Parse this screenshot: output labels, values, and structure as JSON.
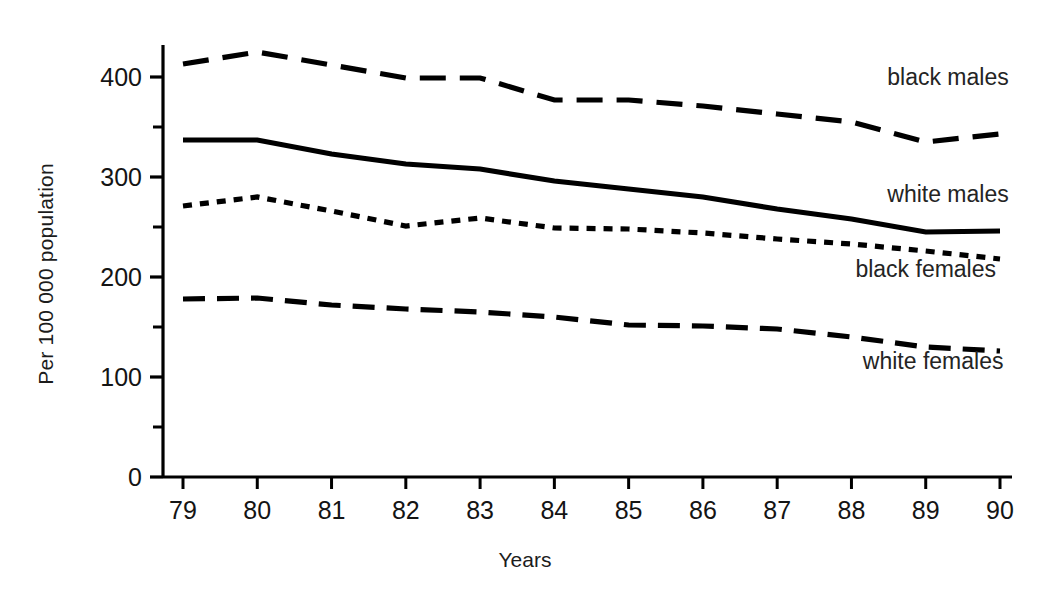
{
  "chart_data": {
    "type": "line",
    "title": "",
    "subtitle": "",
    "xlabel": "Years",
    "ylabel": "Per 100 000 population",
    "categories": [
      "79",
      "80",
      "81",
      "82",
      "83",
      "84",
      "85",
      "86",
      "87",
      "88",
      "89",
      "90"
    ],
    "x": [
      79,
      80,
      81,
      82,
      83,
      84,
      85,
      86,
      87,
      88,
      89,
      90
    ],
    "xlim": [
      79,
      90
    ],
    "ylim": [
      0,
      450
    ],
    "y_major_ticks": [
      0,
      100,
      200,
      300,
      400
    ],
    "y_minor_ticks": [
      50,
      150,
      250,
      350,
      450
    ],
    "y_tick_labels": [
      "0",
      "100",
      "200",
      "300",
      "400"
    ],
    "grid": false,
    "legend_position": "inline-right",
    "series": [
      {
        "name": "black males",
        "style": "long-dash",
        "color": "#000000",
        "values": [
          413,
          425,
          412,
          399,
          399,
          377,
          377,
          371,
          363,
          355,
          335,
          343
        ]
      },
      {
        "name": "white males",
        "style": "solid",
        "color": "#000000",
        "values": [
          337,
          337,
          323,
          313,
          308,
          296,
          288,
          280,
          268,
          258,
          245,
          246
        ]
      },
      {
        "name": "black females",
        "style": "dotted",
        "color": "#000000",
        "values": [
          271,
          280,
          266,
          251,
          259,
          249,
          248,
          244,
          238,
          233,
          226,
          218
        ]
      },
      {
        "name": "white females",
        "style": "dash",
        "color": "#000000",
        "values": [
          178,
          179,
          172,
          168,
          165,
          160,
          152,
          151,
          148,
          140,
          130,
          126
        ]
      }
    ],
    "annotations": [
      {
        "text": "black males",
        "x": 89.3,
        "y": 392
      },
      {
        "text": "white males",
        "x": 89.3,
        "y": 275
      },
      {
        "text": "black females",
        "x": 89.0,
        "y": 200
      },
      {
        "text": "white females",
        "x": 89.1,
        "y": 108
      }
    ]
  },
  "axis": {
    "x_title": "Years",
    "y_title": "Per 100 000 population"
  }
}
